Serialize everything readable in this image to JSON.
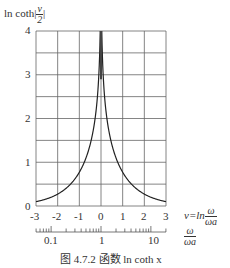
{
  "chart_data": {
    "type": "line",
    "title": "图 4.7.2   函数 ln coth x",
    "ylabel": "ln coth|v/2|",
    "xlabel": "v=ln ω/ωa",
    "secondary_xlabel": "ω/ωa",
    "xlim": [
      -3,
      3
    ],
    "ylim": [
      0,
      4
    ],
    "x_ticks": [
      -3,
      -2,
      -1,
      0,
      1,
      2,
      3
    ],
    "y_ticks": [
      0,
      1,
      2,
      3,
      4
    ],
    "secondary_x_ticks": [
      "0.1",
      "1",
      "10"
    ],
    "grid": true,
    "series": [
      {
        "name": "ln coth|v/2|",
        "x": [
          -3,
          -2.5,
          -2,
          -1.5,
          -1,
          -0.75,
          -0.5,
          -0.25,
          -0.1,
          0.1,
          0.25,
          0.5,
          0.75,
          1,
          1.5,
          2,
          2.5,
          3
        ],
        "values": [
          0.1,
          0.16,
          0.27,
          0.45,
          0.77,
          1.02,
          1.4,
          2.08,
          2.99,
          2.99,
          2.08,
          1.4,
          1.02,
          0.77,
          0.45,
          0.27,
          0.16,
          0.1
        ]
      }
    ]
  },
  "labels": {
    "y_title_prefix": "ln coth|",
    "y_title_num": "v",
    "y_title_den": "2",
    "y_title_suffix": "|",
    "x_title_prefix": "v=ln",
    "x_title_num": "ω",
    "x_title_den": "ωa",
    "sec_title_num": "ω",
    "sec_title_den": "ωa",
    "caption": "图 4.7.2   函数 ln coth x"
  }
}
